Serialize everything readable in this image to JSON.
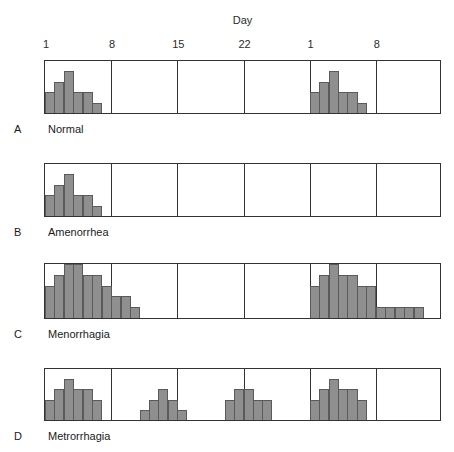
{
  "figure": {
    "axis_title": "Day",
    "tick_labels": [
      "1",
      "8",
      "15",
      "22",
      "1",
      "8"
    ],
    "tick_days": [
      1,
      8,
      15,
      22,
      29,
      36
    ],
    "bar_color": "#8f8f8f",
    "bar_edge_color": "#5a5a5a",
    "panel_border_color": "#333333"
  },
  "chart_data": {
    "type": "bar",
    "xlabel": "Day",
    "ylabel": "",
    "grid": true,
    "legend_position": "none",
    "x_ticks": [
      1,
      8,
      15,
      22,
      29,
      36
    ],
    "x_tick_labels": [
      "1",
      "8",
      "15",
      "22",
      "1",
      "8"
    ],
    "xlim": [
      1,
      43
    ],
    "ylim": [
      0,
      5
    ],
    "note": "Each panel is one bleeding-pattern profile across two menstrual cycles; bar height is relative bleeding volume per day.",
    "series": [
      {
        "name": "Normal",
        "letter": "A",
        "label": "Normal",
        "categories": [
          1,
          2,
          3,
          4,
          5,
          6,
          29,
          30,
          31,
          32,
          33,
          34
        ],
        "values": [
          2,
          3,
          4,
          2,
          2,
          1,
          2,
          3,
          4,
          2,
          2,
          1
        ]
      },
      {
        "name": "Amenorrhea",
        "letter": "B",
        "label": "Amenorrhea",
        "categories": [
          1,
          2,
          3,
          4,
          5,
          6
        ],
        "values": [
          2,
          3,
          4,
          2,
          2,
          1
        ]
      },
      {
        "name": "Menorrhagia",
        "letter": "C",
        "label": "Menorrhagia",
        "categories": [
          1,
          2,
          3,
          4,
          5,
          6,
          7,
          8,
          9,
          10,
          29,
          30,
          31,
          32,
          33,
          34,
          35,
          36,
          37,
          38,
          39,
          40
        ],
        "values": [
          3,
          4,
          5,
          5,
          4,
          4,
          3,
          2,
          2,
          1,
          3,
          4,
          5,
          4,
          4,
          3,
          3,
          1,
          1,
          1,
          1,
          1
        ]
      },
      {
        "name": "Metrorrhagia",
        "letter": "D",
        "label": "Metrorrhagia",
        "categories": [
          1,
          2,
          3,
          4,
          5,
          6,
          11,
          12,
          13,
          14,
          15,
          20,
          21,
          22,
          23,
          24,
          29,
          30,
          31,
          32,
          33,
          34
        ],
        "values": [
          2,
          3,
          4,
          3,
          3,
          2,
          1,
          2,
          3,
          2,
          1,
          2,
          3,
          3,
          2,
          2,
          2,
          3,
          4,
          3,
          3,
          2
        ]
      }
    ]
  }
}
